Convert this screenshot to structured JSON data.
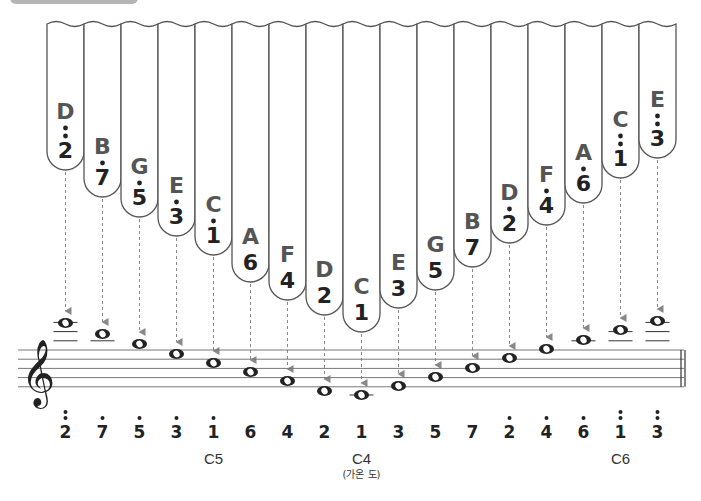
{
  "colors": {
    "tine_outline": "#555555",
    "letter": "#555555",
    "number": "#222222",
    "arrow": "#888888",
    "staff": "#777777",
    "header_bar": "#b5b5b5"
  },
  "tines": [
    {
      "letter": "D",
      "number": "2",
      "dots_above": 2,
      "note": "D6",
      "bottom_y": 170
    },
    {
      "letter": "B",
      "number": "7",
      "dots_above": 1,
      "note": "B5",
      "bottom_y": 197
    },
    {
      "letter": "G",
      "number": "5",
      "dots_above": 1,
      "note": "G5",
      "bottom_y": 217
    },
    {
      "letter": "E",
      "number": "3",
      "dots_above": 1,
      "note": "E5",
      "bottom_y": 236
    },
    {
      "letter": "C",
      "number": "1",
      "dots_above": 1,
      "note": "C5",
      "bottom_y": 255
    },
    {
      "letter": "A",
      "number": "6",
      "dots_above": 0,
      "note": "A4",
      "bottom_y": 282
    },
    {
      "letter": "F",
      "number": "4",
      "dots_above": 0,
      "note": "F4",
      "bottom_y": 300
    },
    {
      "letter": "D",
      "number": "2",
      "dots_above": 0,
      "note": "D4",
      "bottom_y": 315
    },
    {
      "letter": "C",
      "number": "1",
      "dots_above": 0,
      "note": "C4",
      "bottom_y": 332
    },
    {
      "letter": "E",
      "number": "3",
      "dots_above": 0,
      "note": "E4",
      "bottom_y": 308
    },
    {
      "letter": "G",
      "number": "5",
      "dots_above": 0,
      "note": "G4",
      "bottom_y": 290
    },
    {
      "letter": "B",
      "number": "7",
      "dots_above": 0,
      "note": "B4",
      "bottom_y": 267
    },
    {
      "letter": "D",
      "number": "2",
      "dots_above": 1,
      "note": "D5",
      "bottom_y": 243
    },
    {
      "letter": "F",
      "number": "4",
      "dots_above": 1,
      "note": "F5",
      "bottom_y": 225
    },
    {
      "letter": "A",
      "number": "6",
      "dots_above": 1,
      "note": "A5",
      "bottom_y": 203
    },
    {
      "letter": "C",
      "number": "1",
      "dots_above": 2,
      "note": "C6",
      "bottom_y": 178
    },
    {
      "letter": "E",
      "number": "3",
      "dots_above": 2,
      "note": "E6",
      "bottom_y": 158
    }
  ],
  "staff": {
    "clef": "treble",
    "clef_glyph": "𝄞",
    "note_y": [
      323,
      334,
      344,
      354,
      363,
      372,
      381,
      391,
      395,
      386,
      377,
      368,
      358,
      349,
      340,
      330,
      321
    ]
  },
  "bottom_numbers": [
    "2",
    "7",
    "5",
    "3",
    "1",
    "6",
    "4",
    "2",
    "1",
    "3",
    "5",
    "7",
    "2",
    "4",
    "6",
    "1",
    "3"
  ],
  "octave_labels": [
    {
      "text": "C5",
      "tine_index": 4
    },
    {
      "text": "C4",
      "tine_index": 8,
      "sub": "(가온 도)"
    },
    {
      "text": "C6",
      "tine_index": 15
    }
  ]
}
